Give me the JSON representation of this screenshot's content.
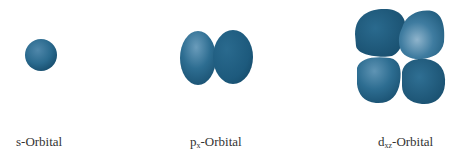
{
  "colors": {
    "lobe_dark": "#1b5577",
    "lobe_mid": "#2a6a8e",
    "lobe_light": "#6a9cbb",
    "text": "#333333"
  },
  "orbitals": [
    {
      "id": "s",
      "prefix": "s",
      "subscript": "",
      "suffix": "-Orbital",
      "lobes": 1
    },
    {
      "id": "px",
      "prefix": "p",
      "subscript": "x",
      "suffix": "-Orbital",
      "lobes": 2
    },
    {
      "id": "dxz",
      "prefix": "d",
      "subscript": "xz",
      "suffix": "-Orbital",
      "lobes": 4
    }
  ]
}
